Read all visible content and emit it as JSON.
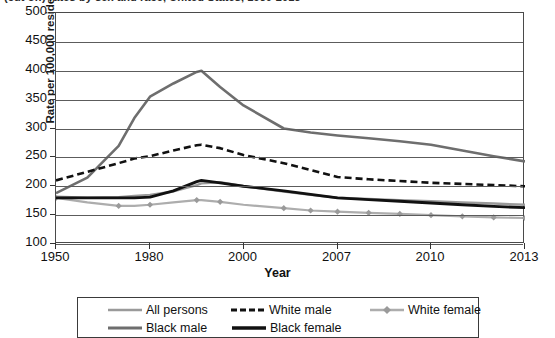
{
  "title": "(cut off) rates by sex and race, United States, 1950-2013",
  "axes": {
    "ylabel": "Rate per 100,000 resident population",
    "xlabel": "Year",
    "yticks": [
      "500",
      "450",
      "400",
      "350",
      "300",
      "250",
      "200",
      "150",
      "100"
    ],
    "xticks": [
      "1950",
      "1980",
      "2000",
      "2007",
      "2010",
      "2013"
    ]
  },
  "legend": {
    "rows": [
      [
        {
          "label": "All persons",
          "style": "solid-light-gray",
          "color": "#9a9a9a"
        },
        {
          "label": "White male",
          "style": "dashed-black",
          "color": "#111111"
        },
        {
          "label": "White female",
          "style": "solid-light-gray-diamond",
          "color": "#adadad"
        }
      ],
      [
        {
          "label": "Black male",
          "style": "solid-medium-gray",
          "color": "#6e6e6e"
        },
        {
          "label": "Black female",
          "style": "solid-thick-black",
          "color": "#111111"
        }
      ]
    ]
  },
  "chart_data": {
    "type": "line",
    "title": "(cut off) rates by sex and race, United States, 1950-2013",
    "xlabel": "Year",
    "ylabel": "Rate per 100,000 resident population",
    "ylim": [
      100,
      500
    ],
    "ygrid": true,
    "ytick_step": 50,
    "legend_position": "bottom",
    "x_axis_note": "category axis with uneven year spacing: 1950, 1980, 2000, 2007, 2010, 2013 are the labeled ticks",
    "x": [
      1950,
      1960,
      1970,
      1975,
      1980,
      1985,
      1990,
      1991,
      1995,
      2000,
      2003,
      2005,
      2007,
      2008,
      2009,
      2010,
      2011,
      2012,
      2013
    ],
    "series": [
      {
        "name": "All persons",
        "color": "#9a9a9a",
        "style": "solid",
        "width": 2.4,
        "values": [
          182,
          180,
          181,
          183,
          185,
          191,
          202,
          205,
          207,
          200,
          191,
          185,
          180,
          178,
          176,
          174,
          172,
          170,
          168
        ]
      },
      {
        "name": "White male",
        "color": "#111111",
        "style": "dashed",
        "width": 2.6,
        "values": [
          210,
          225,
          240,
          248,
          252,
          262,
          271,
          272,
          266,
          254,
          240,
          228,
          216,
          212,
          209,
          206,
          204,
          202,
          200
        ]
      },
      {
        "name": "White female",
        "color": "#adadad",
        "style": "solid",
        "marker": "diamond",
        "width": 2.2,
        "values": [
          180,
          172,
          166,
          166,
          168,
          172,
          176,
          176,
          173,
          168,
          162,
          158,
          156,
          154,
          152,
          150,
          148,
          146,
          145
        ]
      },
      {
        "name": "Black male",
        "color": "#6e6e6e",
        "style": "solid",
        "width": 2.6,
        "values": [
          188,
          215,
          270,
          318,
          355,
          378,
          398,
          400,
          372,
          340,
          300,
          293,
          288,
          283,
          278,
          272,
          262,
          252,
          243
        ]
      },
      {
        "name": "Black female",
        "color": "#111111",
        "style": "solid",
        "width": 2.8,
        "values": [
          180,
          180,
          180,
          180,
          181,
          192,
          208,
          210,
          206,
          200,
          192,
          186,
          180,
          177,
          174,
          171,
          168,
          165,
          163
        ]
      }
    ]
  }
}
